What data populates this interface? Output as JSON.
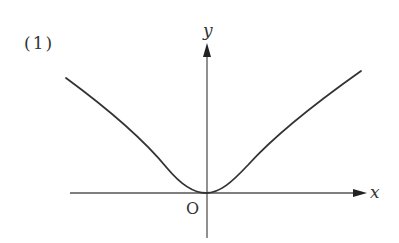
{
  "figure": {
    "label": "(1)",
    "x_axis_label": "x",
    "y_axis_label": "y",
    "origin_label": "O",
    "colors": {
      "axis": "#555555",
      "curve": "#333333",
      "text": "#333333"
    }
  },
  "diagram": {
    "type": "function-graph",
    "axes": {
      "x_axis": {
        "from": [
          70,
          193
        ],
        "to": [
          366,
          193
        ],
        "arrow": true
      },
      "y_axis": {
        "from": [
          207,
          238
        ],
        "to": [
          207,
          44
        ],
        "arrow": true
      }
    },
    "origin_px": [
      206,
      193
    ],
    "curve_points_px": [
      [
        66,
        78
      ],
      [
        110,
        113
      ],
      [
        167,
        168
      ],
      [
        206,
        193
      ],
      [
        245,
        168
      ],
      [
        300,
        118
      ],
      [
        361,
        71
      ]
    ]
  }
}
